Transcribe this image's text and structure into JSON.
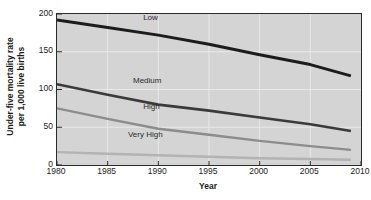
{
  "chart_data": {
    "type": "line",
    "title": "",
    "xlabel": "Year",
    "ylabel_line1": "Under-five mortality rate",
    "ylabel_line2": "per 1,000 live births",
    "xlim": [
      1980,
      2010
    ],
    "ylim": [
      0,
      200
    ],
    "xticks": [
      1980,
      1985,
      1990,
      1995,
      2000,
      2005,
      2010
    ],
    "yticks": [
      0,
      50,
      100,
      150,
      200
    ],
    "grid": true,
    "legend_position": "inline-labels",
    "x": [
      1980,
      1985,
      1990,
      1995,
      2000,
      2005,
      2009
    ],
    "series": [
      {
        "name": "Low",
        "label": "Low",
        "color": "#1c1c1c",
        "width": 3.0,
        "values": [
          192,
          182,
          172,
          160,
          146,
          133,
          118
        ]
      },
      {
        "name": "Medium",
        "label": "Medium",
        "color": "#3a3a3a",
        "width": 2.6,
        "values": [
          107,
          93,
          80,
          72,
          63,
          54,
          45
        ]
      },
      {
        "name": "High",
        "label": "High",
        "color": "#8c8c8c",
        "width": 2.4,
        "values": [
          75,
          61,
          48,
          40,
          32,
          25,
          20
        ]
      },
      {
        "name": "Very High",
        "label": "Very High",
        "color": "#b3b3b3",
        "width": 2.4,
        "values": [
          17,
          15,
          13,
          11,
          9,
          8,
          7
        ]
      }
    ],
    "series_label_positions": [
      {
        "name": "Low",
        "x_year": 1988.5,
        "y_value": 190
      },
      {
        "name": "Medium",
        "x_year": 1987.5,
        "y_value": 106
      },
      {
        "name": "High",
        "x_year": 1988.5,
        "y_value": 72
      },
      {
        "name": "Very High",
        "x_year": 1987.0,
        "y_value": 34
      }
    ],
    "colors": {
      "plot_background": "#d4d4d4",
      "gridline": "#e8e8e8",
      "axis": "#2b2b2b",
      "text": "#1a1a1a",
      "page_background": "#ffffff"
    }
  }
}
